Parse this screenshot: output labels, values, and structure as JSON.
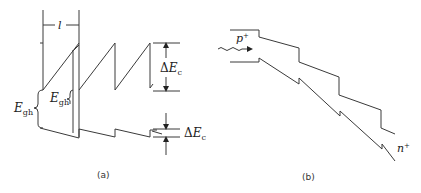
{
  "panel_a": {
    "caption": "(a)",
    "period_label": "l",
    "delta_ec_top": {
      "delta": "Δ",
      "symbol": "E",
      "sub": "c"
    },
    "delta_ec_bottom": {
      "delta": "Δ",
      "symbol": "E",
      "sub": "c"
    },
    "egh_outer": {
      "symbol": "E",
      "sub": "gh"
    },
    "egh_inner": {
      "symbol": "E",
      "sub": "gh"
    }
  },
  "panel_b": {
    "caption": "(b)",
    "p_label": {
      "symbol": "p",
      "sup": "+"
    },
    "n_label": {
      "symbol": "n",
      "sup": "+"
    }
  },
  "colors": {
    "line": "#3a3a3a",
    "text": "#222222",
    "background": "#ffffff"
  }
}
